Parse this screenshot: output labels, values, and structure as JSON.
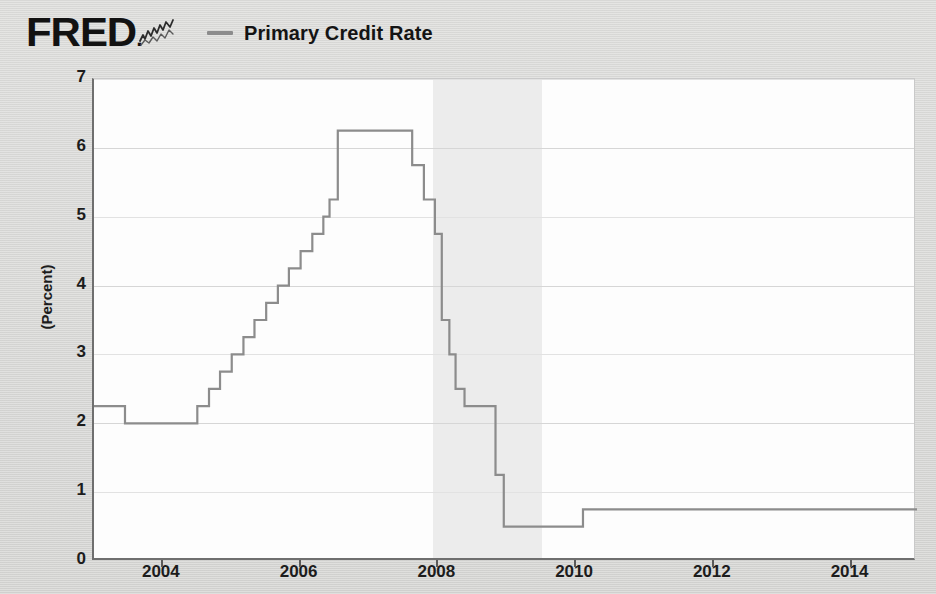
{
  "header": {
    "logo_text": "FRED",
    "logo_icon": "line-chart-squiggle-icon",
    "legend": {
      "swatch": "line-swatch",
      "label": "Primary Credit Rate"
    }
  },
  "chart_data": {
    "type": "line",
    "title": "Primary Credit Rate",
    "xlabel": "",
    "ylabel": "(Percent)",
    "units": "Percent",
    "step_style": "step-post",
    "xlim": [
      2003.0,
      2014.95
    ],
    "ylim": [
      0,
      7
    ],
    "yticks": [
      0,
      1,
      2,
      3,
      4,
      5,
      6,
      7
    ],
    "ytick_labels": [
      "0",
      "1",
      "2",
      "3",
      "4",
      "5",
      "6",
      "7"
    ],
    "xticks": [
      2004,
      2006,
      2008,
      2010,
      2012,
      2014
    ],
    "xtick_labels": [
      "2004",
      "2006",
      "2008",
      "2010",
      "2012",
      "2014"
    ],
    "grid": true,
    "legend_position": "top",
    "line_color": "#8c8c8c",
    "recession_color": "#ececec",
    "background_color": "#fdfdfd",
    "recessions": [
      {
        "start": 2007.92,
        "end": 2009.5,
        "label": "2008 recession"
      }
    ],
    "series": [
      {
        "name": "Primary Credit Rate",
        "color": "#8c8c8c",
        "x": [
          2003.0,
          2003.45,
          2004.5,
          2004.67,
          2004.83,
          2005.0,
          2005.17,
          2005.33,
          2005.5,
          2005.67,
          2005.83,
          2006.0,
          2006.17,
          2006.33,
          2006.42,
          2006.54,
          2007.62,
          2007.79,
          2007.95,
          2008.05,
          2008.16,
          2008.25,
          2008.38,
          2008.83,
          2008.95,
          2010.1,
          2014.95
        ],
        "y": [
          2.25,
          2.0,
          2.25,
          2.5,
          2.75,
          3.0,
          3.25,
          3.5,
          3.75,
          4.0,
          4.25,
          4.5,
          4.75,
          5.0,
          5.25,
          6.25,
          5.75,
          5.25,
          4.75,
          3.5,
          3.0,
          2.5,
          2.25,
          1.25,
          0.5,
          0.75,
          0.75
        ]
      }
    ],
    "annotations": [
      {
        "text": "Peak plateau 6.25 percent, mid-2006 to mid-2007"
      },
      {
        "text": "Trough 0.50 percent, late 2008 to early 2010"
      },
      {
        "text": "Final level 0.75 percent"
      }
    ]
  },
  "axis": {
    "y_title": "(Percent)"
  }
}
